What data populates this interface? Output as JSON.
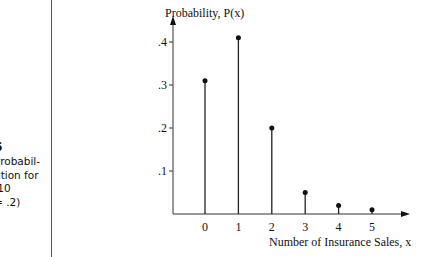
{
  "caption": {
    "figure_number": "6",
    "lines": [
      "Probabil-",
      "ution for",
      ".10",
      "= .2)"
    ]
  },
  "chart_data": {
    "type": "bar",
    "style": "stem",
    "title": "",
    "ylabel": "Probability, P(x)",
    "xlabel": "Number of Insurance Sales, x",
    "categories": [
      "0",
      "1",
      "2",
      "3",
      "4",
      "5"
    ],
    "values": [
      0.31,
      0.41,
      0.2,
      0.05,
      0.02,
      0.01
    ],
    "yticks": [
      ".1",
      ".2",
      ".3",
      ".4"
    ],
    "ytick_values": [
      0.1,
      0.2,
      0.3,
      0.4
    ],
    "ylim": [
      0,
      0.45
    ],
    "grid": false,
    "legend": "none"
  },
  "colors": {
    "ink": "#111111",
    "axis": "#333333"
  }
}
